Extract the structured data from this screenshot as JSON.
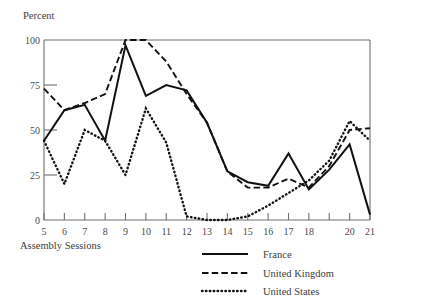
{
  "chart_data": {
    "type": "line",
    "title": "",
    "ylabel": "Percent",
    "xlabel": "Assembly Sessions",
    "ylim": [
      0,
      100
    ],
    "xlim": [
      5,
      21
    ],
    "yticks": [
      0,
      25,
      50,
      75,
      100
    ],
    "ytick_labels": [
      "0",
      "25",
      "50",
      "75",
      "100"
    ],
    "xticks": [
      5,
      6,
      7,
      8,
      9,
      10,
      11,
      12,
      13,
      14,
      15,
      16,
      17,
      18,
      19,
      20,
      21
    ],
    "xtick_labels": [
      "5",
      "6",
      "7",
      "8",
      "9",
      "10",
      "11",
      "12",
      "13",
      "14",
      "15",
      "16",
      "17",
      "18",
      "",
      "20",
      "21"
    ],
    "grid": false,
    "legend_position": "bottom-right",
    "x": [
      5,
      6,
      7,
      8,
      9,
      10,
      11,
      12,
      13,
      14,
      15,
      16,
      17,
      18,
      19,
      20,
      21
    ],
    "series": [
      {
        "name": "France",
        "style": "solid",
        "values": [
          44,
          61,
          64,
          44,
          97,
          69,
          75,
          72,
          54,
          27,
          21,
          19,
          37,
          17,
          28,
          42,
          3
        ]
      },
      {
        "name": "United Kingdom",
        "style": "dashed",
        "values": [
          73,
          61,
          65,
          70,
          100,
          100,
          88,
          70,
          54,
          27,
          18,
          18,
          23,
          18,
          30,
          50,
          51
        ]
      },
      {
        "name": "United States",
        "style": "dotted",
        "values": [
          44,
          20,
          50,
          44,
          25,
          62,
          43,
          2,
          0,
          0,
          2,
          8,
          15,
          22,
          33,
          55,
          44
        ]
      }
    ]
  },
  "axis": {
    "ylabel": "Percent",
    "xlabel": "Assembly Sessions",
    "ytick_labels": [
      "100",
      "75",
      "50",
      "25",
      "0"
    ],
    "xtick_labels": [
      "5",
      "6",
      "7",
      "8",
      "9",
      "10",
      "11",
      "12",
      "13",
      "14",
      "15",
      "16",
      "17",
      "18",
      "20",
      "21"
    ]
  },
  "legend": {
    "entries": [
      {
        "label": "France",
        "style": "solid"
      },
      {
        "label": "United Kingdom",
        "style": "dashed"
      },
      {
        "label": "United States",
        "style": "dotted"
      }
    ]
  },
  "colors": {
    "line": "#111111",
    "axis": "#6e6e6e",
    "text": "#3c3c3c",
    "background": "#ffffff"
  }
}
